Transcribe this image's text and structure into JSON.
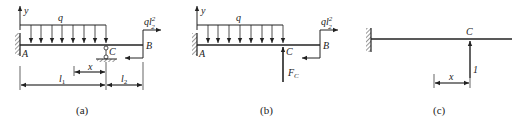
{
  "figures": [
    {
      "id": "a",
      "caption": "(a)",
      "labels": {
        "y_axis": "y",
        "load": "q",
        "moment": "ql",
        "moment_sup": "2",
        "moment_sub": "2",
        "point_a": "A",
        "point_b": "B",
        "point_c": "C",
        "dim_x": "x",
        "dim_l1": "l",
        "dim_l1_sub": "1",
        "dim_l2": "l",
        "dim_l2_sub": "2"
      }
    },
    {
      "id": "b",
      "caption": "(b)",
      "labels": {
        "y_axis": "y",
        "load": "q",
        "moment": "ql",
        "moment_sup": "2",
        "moment_sub": "2",
        "point_a": "A",
        "point_b": "B",
        "point_c": "C",
        "force": "F",
        "force_sub": "C"
      }
    },
    {
      "id": "c",
      "caption": "(c)",
      "labels": {
        "point_c": "C",
        "unit_force": "1",
        "dim_x": "x"
      }
    }
  ]
}
